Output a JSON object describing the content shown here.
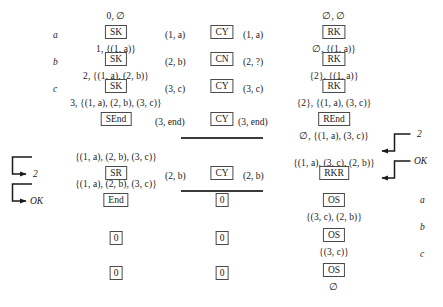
{
  "diagram": {
    "columns": {
      "left_label": "role-column",
      "sender": "sender-column",
      "channel": "channel-column",
      "receiver": "receiver-column",
      "right_label": "output-column"
    },
    "row_labels_left": [
      "a",
      "b",
      "c"
    ],
    "row_labels_right": [
      "a",
      "b",
      "c"
    ],
    "sender_boxes": [
      "SK",
      "SK",
      "SK",
      "SEnd",
      "SR",
      "End",
      "0",
      "0"
    ],
    "channel_boxes": [
      "CY",
      "CN",
      "CY",
      "CY",
      "CY",
      "0",
      "0",
      "0"
    ],
    "receiver_boxes": [
      "RK",
      "RK",
      "RK",
      "REnd",
      "RKR",
      "OS",
      "OS",
      "OS"
    ],
    "sender_states": [
      "0, ∅",
      "1, {(1, a)}",
      "2, {(1, a), (2, b)}",
      "3, {(1, a), (2, b), (3, c)}",
      "{(1, a), (2, b), (3, c)}",
      "{(1, a), (2, b), (3, c)}"
    ],
    "receiver_states": [
      "∅, ∅",
      "∅, {(1, a)}",
      "{2}, {(1, a)}",
      "{2}, {(1, a), (3, c)}",
      "∅, {(1, a), (3, c)}",
      "{(1, a), (3, c), (2, b)}",
      "{(3, c), (2, b)}",
      "{(3, c)}",
      "∅"
    ],
    "channel_messages": [
      {
        "in": "(1, a)",
        "label": "CY",
        "out": "(1, a)"
      },
      {
        "in": "(2, b)",
        "label": "CN",
        "out": "(2, ?)"
      },
      {
        "in": "(3, c)",
        "label": "CY",
        "out": "(3, c)"
      },
      {
        "in": "(3, end)",
        "label": "CY",
        "out": "(3, end)"
      },
      {
        "in": "(2, b)",
        "label": "CY",
        "out": "(2, b)"
      }
    ],
    "feedback_labels_right": [
      "2",
      "OK"
    ],
    "feedback_labels_left": [
      "2",
      "OK"
    ],
    "colors": {
      "ink": "#1a1a1a",
      "box_border": "#4a4a4a",
      "rule": "#3a3a3a",
      "background": "#ffffff"
    }
  }
}
